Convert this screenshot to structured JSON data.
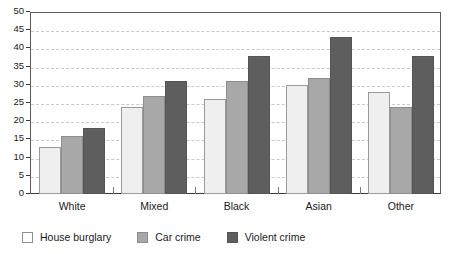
{
  "chart_data": {
    "type": "bar",
    "title": "",
    "subtitle": "",
    "xlabel": "",
    "ylabel": "",
    "categories": [
      "White",
      "Mixed",
      "Black",
      "Asian",
      "Other"
    ],
    "series": [
      {
        "name": "House burglary",
        "color": "#efefef",
        "values": [
          13,
          24,
          26,
          30,
          28
        ]
      },
      {
        "name": "Car crime",
        "color": "#a8a8a8",
        "values": [
          16,
          27,
          31,
          32,
          24
        ]
      },
      {
        "name": "Violent crime",
        "color": "#5e5e5e",
        "values": [
          18,
          31,
          38,
          43,
          38
        ]
      }
    ],
    "ylim": [
      0,
      50
    ],
    "yticks": [
      0,
      5,
      10,
      15,
      20,
      25,
      30,
      35,
      40,
      45,
      50
    ],
    "ytick_labels": [
      "0",
      "5",
      "10",
      "15",
      "20",
      "25",
      "30",
      "35",
      "40",
      "45",
      "50"
    ],
    "grid": true,
    "grid_style": "dashed",
    "grid_color": "#c9c9cf",
    "legend_position": "bottom-left",
    "axis_color": "#3a3a3a",
    "background": "#ffffff"
  },
  "legend": {
    "items": [
      {
        "label": "House burglary",
        "swatch": "legend-swatch-house-burglary"
      },
      {
        "label": "Car crime",
        "swatch": "legend-swatch-car-crime"
      },
      {
        "label": "Violent crime",
        "swatch": "legend-swatch-violent-crime"
      }
    ]
  }
}
